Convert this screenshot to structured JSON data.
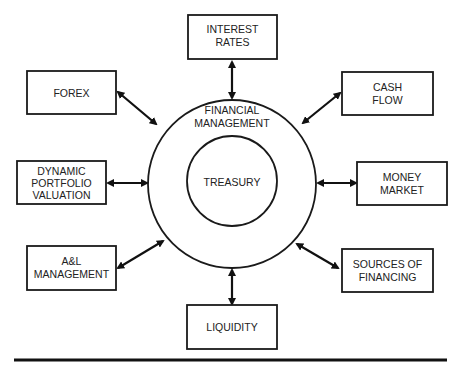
{
  "diagram": {
    "center": {
      "outer_label": [
        "FINANCIAL",
        "MANAGEMENT"
      ],
      "inner_label": "TREASURY"
    },
    "nodes": [
      {
        "id": "interest-rates",
        "lines": [
          "INTEREST",
          "RATES"
        ]
      },
      {
        "id": "forex",
        "lines": [
          "FOREX"
        ]
      },
      {
        "id": "cash-flow",
        "lines": [
          "CASH",
          "FLOW"
        ]
      },
      {
        "id": "dynamic-portfolio-valuation",
        "lines": [
          "DYNAMIC",
          "PORTFOLIO",
          "VALUATION"
        ]
      },
      {
        "id": "money-market",
        "lines": [
          "MONEY",
          "MARKET"
        ]
      },
      {
        "id": "al-management",
        "lines": [
          "A&L",
          "MANAGEMENT"
        ]
      },
      {
        "id": "sources-of-financing",
        "lines": [
          "SOURCES OF",
          "FINANCING"
        ]
      },
      {
        "id": "liquidity",
        "lines": [
          "LIQUIDITY"
        ]
      }
    ],
    "connections": "bidirectional arrows between each node and the Financial Management circle"
  }
}
